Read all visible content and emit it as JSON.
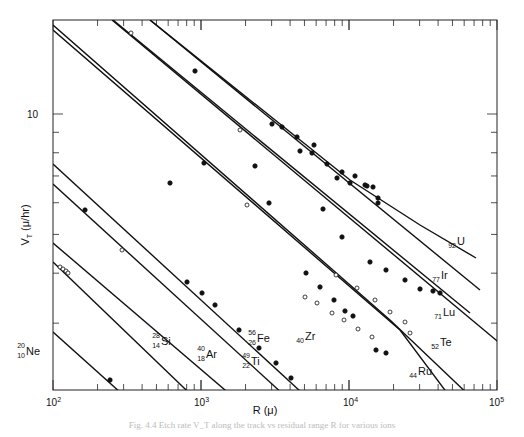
{
  "chart_data": {
    "type": "line",
    "title": "",
    "xlabel": "R (μ)",
    "ylabel": "V_T (μ/hr)",
    "xscale": "log",
    "yscale": "log",
    "xlim": [
      100,
      100000
    ],
    "x_ticks": [
      "10^2",
      "10^3",
      "10^4",
      "10^5"
    ],
    "y_ticks": [
      "10"
    ],
    "grid": false,
    "legend": "none (curves labeled inline)",
    "series": [
      {
        "name": "Ne",
        "mass": "20",
        "z": "10",
        "marker": "filled",
        "points_px": [
          [
            110,
            380
          ]
        ],
        "line_px": [
          [
            53,
            332
          ],
          [
            170,
            437
          ]
        ]
      },
      {
        "name": "Si",
        "mass": "28",
        "z": "14",
        "marker": "none",
        "points_px": [],
        "line_px": [
          [
            53,
            262
          ],
          [
            235,
            437
          ]
        ]
      },
      {
        "name": "Ar",
        "mass": "40",
        "z": "18",
        "marker": "open",
        "points_px": [
          [
            60,
            267
          ],
          [
            63,
            269
          ],
          [
            66,
            271
          ],
          [
            68,
            273
          ],
          [
            122,
            250
          ]
        ],
        "line_px": [
          [
            53,
            243
          ],
          [
            280,
            437
          ]
        ]
      },
      {
        "name": "Ti",
        "mass": "49",
        "z": "22",
        "marker": "filled",
        "points_px": [
          [
            85,
            210
          ]
        ],
        "line_px": [
          [
            53,
            184
          ],
          [
            330,
            437
          ]
        ]
      },
      {
        "name": "Fe",
        "mass": "56",
        "z": "26",
        "marker": "filled",
        "points_px": [
          [
            187,
            282
          ],
          [
            202,
            293
          ],
          [
            215,
            305
          ],
          [
            239,
            330
          ],
          [
            259,
            348
          ],
          [
            276,
            363
          ],
          [
            291,
            378
          ]
        ],
        "line_px": [
          [
            53,
            164
          ],
          [
            350,
            437
          ]
        ]
      },
      {
        "name": "Zr",
        "mass": "40",
        "z": "40",
        "marker": "open",
        "points_px": [
          [
            305,
            297
          ],
          [
            317,
            303
          ],
          [
            332,
            313
          ],
          [
            344,
            320
          ],
          [
            358,
            329
          ],
          [
            372,
            337
          ]
        ],
        "line_px": [
          [
            53,
            30
          ],
          [
            400,
            330
          ],
          [
            480,
            437
          ]
        ]
      },
      {
        "name": "Ru",
        "mass": "",
        "z": "44",
        "marker": "filled",
        "points_px": [
          [
            255,
            166
          ],
          [
            306,
            273
          ],
          [
            320,
            287
          ],
          [
            334,
            300
          ],
          [
            345,
            311
          ],
          [
            353,
            316
          ],
          [
            376,
            350
          ],
          [
            386,
            353
          ]
        ],
        "line_px": [
          [
            53,
            25
          ],
          [
            390,
            320
          ],
          [
            495,
            420
          ]
        ]
      },
      {
        "name": "Te",
        "mass": "",
        "z": "52",
        "marker": "open",
        "points_px": [
          [
            131,
            33
          ],
          [
            240,
            130
          ],
          [
            247,
            205
          ],
          [
            336,
            275
          ],
          [
            357,
            288
          ],
          [
            375,
            300
          ],
          [
            390,
            312
          ],
          [
            405,
            322
          ],
          [
            410,
            333
          ]
        ],
        "line_px": [
          [
            112,
            20
          ],
          [
            520,
            360
          ]
        ]
      },
      {
        "name": "Lu",
        "mass": "",
        "z": "71",
        "marker": "filled",
        "points_px": [
          [
            170,
            183
          ],
          [
            204,
            163
          ],
          [
            269,
            203
          ],
          [
            323,
            209
          ],
          [
            342,
            237
          ],
          [
            370,
            262
          ],
          [
            386,
            270
          ],
          [
            405,
            280
          ],
          [
            420,
            289
          ],
          [
            433,
            291
          ],
          [
            440,
            293
          ]
        ],
        "line_px": [
          [
            113,
            20
          ],
          [
            470,
            313
          ]
        ]
      },
      {
        "name": "Ir",
        "mass": "",
        "z": "77",
        "marker": "filled",
        "points_px": [
          [
            272,
            124
          ],
          [
            300,
            151
          ],
          [
            314,
            145
          ],
          [
            327,
            164
          ],
          [
            342,
            172
          ],
          [
            355,
            176
          ],
          [
            367,
            186
          ],
          [
            373,
            187
          ],
          [
            378,
            203
          ]
        ],
        "line_px": [
          [
            150,
            20
          ],
          [
            480,
            290
          ]
        ]
      },
      {
        "name": "U",
        "mass": "",
        "z": "92",
        "marker": "filled",
        "points_px": [
          [
            195,
            71
          ],
          [
            282,
            127
          ],
          [
            297,
            137
          ],
          [
            312,
            153
          ],
          [
            337,
            178
          ],
          [
            350,
            183
          ],
          [
            365,
            185
          ],
          [
            378,
            198
          ]
        ],
        "line_px": [
          [
            150,
            20
          ],
          [
            350,
            180
          ],
          [
            420,
            225
          ],
          [
            476,
            258
          ]
        ]
      }
    ],
    "labels": [
      {
        "text": "Ne",
        "sup": "20",
        "sub": "10",
        "x": 25,
        "y": 355
      },
      {
        "text": "Si",
        "sup": "28",
        "sub": "14",
        "x": 160,
        "y": 345
      },
      {
        "text": "Ar",
        "sup": "40",
        "sub": "18",
        "x": 205,
        "y": 358
      },
      {
        "text": "Ti",
        "sup": "49",
        "sub": "22",
        "x": 250,
        "y": 365
      },
      {
        "text": "Fe",
        "sup": "56",
        "sub": "26",
        "x": 256,
        "y": 342
      },
      {
        "text": "Zr",
        "sup": "",
        "sub": "40",
        "x": 304,
        "y": 340
      },
      {
        "text": "Ru",
        "sup": "",
        "sub": "44",
        "x": 417,
        "y": 375
      },
      {
        "text": "Te",
        "sup": "",
        "sub": "52",
        "x": 439,
        "y": 346
      },
      {
        "text": "Lu",
        "sup": "",
        "sub": "71",
        "x": 442,
        "y": 316
      },
      {
        "text": "Ir",
        "sup": "",
        "sub": "77",
        "x": 440,
        "y": 279
      },
      {
        "text": "U",
        "sup": "",
        "sub": "92",
        "x": 456,
        "y": 245
      }
    ]
  },
  "axes": {
    "x_label_main": "R",
    "x_label_unit": "(μ)",
    "y_label_main": "V",
    "y_label_sub": "T",
    "y_label_unit": "(μ/hr)",
    "x_ticks": [
      {
        "base": "10",
        "exp": "2"
      },
      {
        "base": "10",
        "exp": "3"
      },
      {
        "base": "10",
        "exp": "4"
      },
      {
        "base": "10",
        "exp": "5"
      }
    ],
    "y_tick_label": "10"
  },
  "caption": "Fig. 4.4  Etch rate V_T along the track vs residual range R for various ions"
}
